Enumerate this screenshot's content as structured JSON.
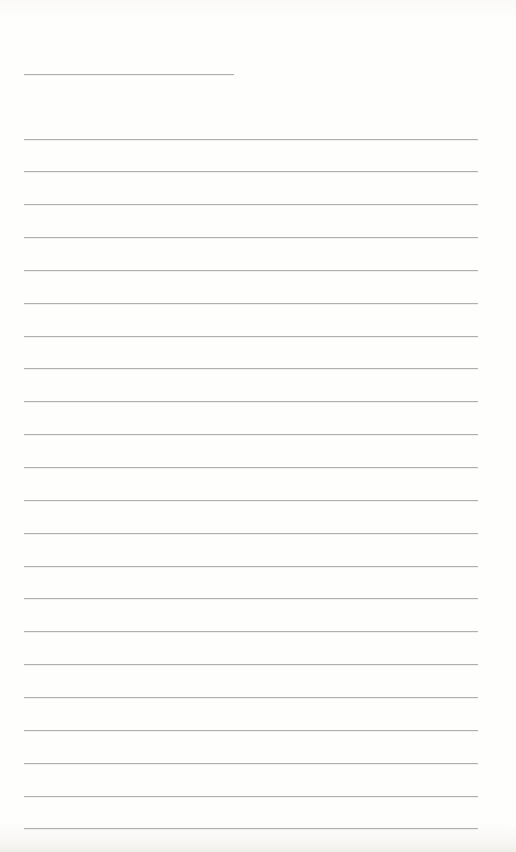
{
  "page": {
    "type": "blank-lined-notebook-page",
    "width": 516,
    "height": 852,
    "background_color": "#fefefd",
    "edge_texture_color": "#efeeea",
    "text_content": ""
  },
  "ruled_lines": {
    "line_color": "#b2b0ad",
    "line_thickness_px": 1,
    "short_title_line": {
      "x": 24,
      "y": 74,
      "width": 210
    },
    "full_lines": {
      "count": 22,
      "x": 24,
      "y_start": 138.5,
      "spacing": 32.85,
      "width": 454
    }
  }
}
